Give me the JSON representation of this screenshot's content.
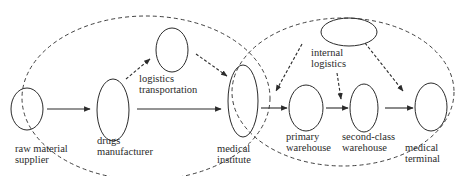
{
  "diagram": {
    "nodes": [
      {
        "id": "raw",
        "line1": "raw material",
        "line2": "supplier"
      },
      {
        "id": "drugs",
        "line1": "drugs",
        "line2": "manufacturer"
      },
      {
        "id": "logistics",
        "line1": "logistics",
        "line2": "transportation"
      },
      {
        "id": "institute",
        "line1": "medical",
        "line2": "institute"
      },
      {
        "id": "primary",
        "line1": "primary",
        "line2": "warehouse"
      },
      {
        "id": "second",
        "line1": "second-class",
        "line2": "warehouse"
      },
      {
        "id": "terminal",
        "line1": "medical",
        "line2": "terminal"
      },
      {
        "id": "internal",
        "line1": "internal",
        "line2": "logistics"
      }
    ],
    "edges": [
      {
        "from": "raw material supplier",
        "to": "drugs manufacturer",
        "style": "solid"
      },
      {
        "from": "drugs manufacturer",
        "to": "logistics transportation",
        "style": "dashed"
      },
      {
        "from": "logistics transportation",
        "to": "medical institute",
        "style": "dashed"
      },
      {
        "from": "drugs manufacturer",
        "to": "medical institute",
        "style": "solid"
      },
      {
        "from": "medical institute",
        "to": "primary warehouse",
        "style": "solid"
      },
      {
        "from": "primary warehouse",
        "to": "second-class warehouse",
        "style": "solid"
      },
      {
        "from": "second-class warehouse",
        "to": "medical terminal",
        "style": "solid"
      },
      {
        "from": "internal logistics",
        "to": "primary warehouse",
        "style": "dashed"
      },
      {
        "from": "internal logistics",
        "to": "second-class warehouse",
        "style": "dashed"
      },
      {
        "from": "internal logistics",
        "to": "medical terminal",
        "style": "dashed"
      }
    ],
    "groups": [
      {
        "name": "upstream-group",
        "style": "dashed-ellipse"
      },
      {
        "name": "downstream-group",
        "style": "dashed-ellipse"
      }
    ],
    "colors": {
      "stroke": "#2b2b2b",
      "text": "#2b2b2b",
      "background": "#ffffff"
    }
  }
}
